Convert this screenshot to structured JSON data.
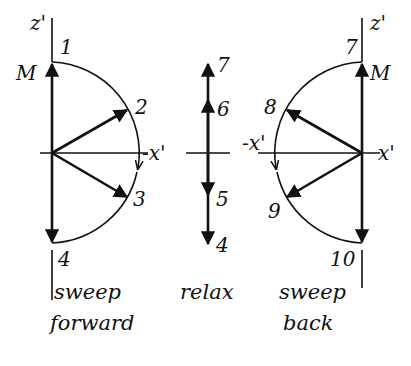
{
  "panels": {
    "sweep_forward": {
      "axis_z": "z'",
      "axis_x": "-x'",
      "magnetization": "M",
      "points": [
        "1",
        "2",
        "3",
        "4"
      ],
      "caption_line1": "sweep",
      "caption_line2": "forward"
    },
    "relax": {
      "points": [
        "7",
        "6",
        "5",
        "4"
      ],
      "caption": "relax"
    },
    "sweep_back": {
      "axis_z": "z'",
      "axis_x": "x'",
      "axis_neg_x": "-x'",
      "magnetization": "M",
      "points": [
        "7",
        "8",
        "9",
        "10"
      ],
      "caption_line1": "sweep",
      "caption_line2": "back"
    }
  },
  "colors": {
    "ink": "#111111",
    "background": "#ffffff"
  }
}
